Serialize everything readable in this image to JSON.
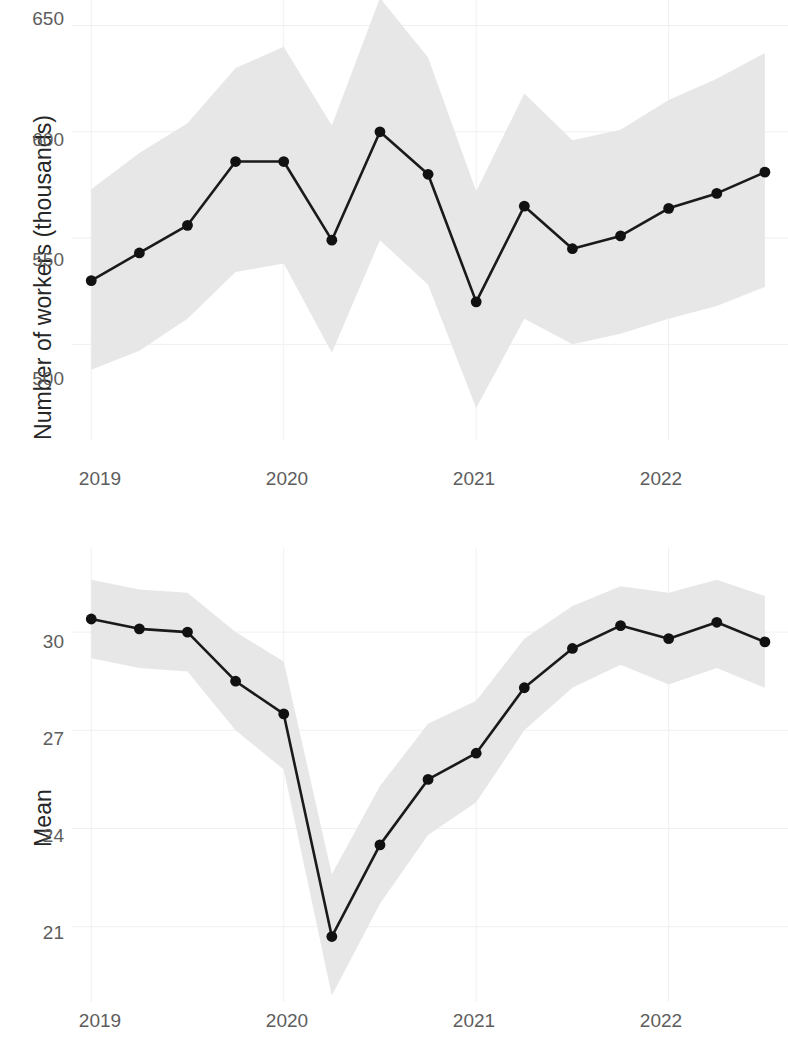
{
  "chart_data": [
    {
      "panel": "top",
      "type": "line",
      "title": "",
      "xlabel": "",
      "ylabel": "Number of workers (thousands)",
      "x": [
        2019.0,
        2019.25,
        2019.5,
        2019.75,
        2020.0,
        2020.25,
        2020.5,
        2020.75,
        2021.0,
        2021.25,
        2021.5,
        2021.75,
        2022.0,
        2022.25,
        2022.5
      ],
      "x_tick_labels": [
        "2019",
        "2020",
        "2021",
        "2022"
      ],
      "x_tick_values": [
        2019,
        2020,
        2021,
        2022
      ],
      "y_tick_labels": [
        "500",
        "550",
        "600",
        "650"
      ],
      "y_tick_values": [
        500,
        550,
        600,
        650
      ],
      "ylim": [
        455,
        662
      ],
      "xlim": [
        2018.9,
        2022.62
      ],
      "grid": true,
      "legend": "none",
      "series": [
        {
          "name": "Number of workers (thousands)",
          "values": [
            530,
            543,
            556,
            586,
            586,
            549,
            600,
            580,
            520,
            565,
            545,
            551,
            564,
            571,
            581
          ],
          "ci_lower": [
            488,
            497,
            512,
            534,
            538,
            496,
            549,
            528,
            470,
            512,
            500,
            505,
            512,
            518,
            527
          ],
          "ci_upper": [
            573,
            590,
            604,
            630,
            640,
            603,
            663,
            635,
            572,
            618,
            596,
            601,
            615,
            625,
            637
          ]
        }
      ]
    },
    {
      "panel": "bottom",
      "type": "line",
      "title": "",
      "xlabel": "",
      "ylabel": "Mean",
      "x": [
        2019.0,
        2019.25,
        2019.5,
        2019.75,
        2020.0,
        2020.25,
        2020.5,
        2020.75,
        2021.0,
        2021.25,
        2021.5,
        2021.75,
        2022.0,
        2022.25,
        2022.5
      ],
      "x_tick_labels": [
        "2019",
        "2020",
        "2021",
        "2022"
      ],
      "x_tick_values": [
        2019,
        2020,
        2021,
        2022
      ],
      "y_tick_labels": [
        "21",
        "24",
        "27",
        "30"
      ],
      "y_tick_values": [
        21,
        24,
        27,
        30
      ],
      "ylim": [
        18.7,
        32.6
      ],
      "xlim": [
        2018.9,
        2022.62
      ],
      "grid": true,
      "legend": "none",
      "series": [
        {
          "name": "Mean",
          "values": [
            30.4,
            30.1,
            30.0,
            28.5,
            27.5,
            20.7,
            23.5,
            25.5,
            26.3,
            28.3,
            29.5,
            30.2,
            29.8,
            30.3,
            29.7
          ],
          "ci_lower": [
            29.2,
            28.9,
            28.8,
            27.0,
            25.8,
            18.9,
            21.7,
            23.8,
            24.8,
            27.0,
            28.3,
            29.0,
            28.4,
            28.9,
            28.3
          ],
          "ci_upper": [
            31.6,
            31.3,
            31.2,
            30.0,
            29.1,
            22.6,
            25.3,
            27.2,
            27.9,
            29.8,
            30.8,
            31.4,
            31.2,
            31.6,
            31.1
          ]
        }
      ]
    }
  ],
  "panels": {
    "top": {
      "y_axis_title": "Number of workers (thousands)",
      "y_ticks": [
        "650",
        "600",
        "550",
        "500"
      ],
      "x_ticks": [
        "2019",
        "2020",
        "2021",
        "2022"
      ]
    },
    "bottom": {
      "y_axis_title": "Mean",
      "y_ticks": [
        "30",
        "27",
        "24",
        "21"
      ],
      "x_ticks": [
        "2019",
        "2020",
        "2021",
        "2022"
      ]
    }
  },
  "colors": {
    "line": "#111111",
    "point": "#111111",
    "band": "#e6e6e6",
    "grid": "#f0f0f0",
    "tick_text": "#5d5d5d",
    "axis_title": "#262626"
  }
}
